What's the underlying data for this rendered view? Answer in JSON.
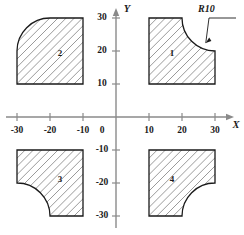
{
  "figure": {
    "background_color": "#ffffff",
    "line_color": "#1a1a1a",
    "axis_color": "#8a8a8a",
    "hatch_color": "#6e6e6e"
  },
  "axes": {
    "x_name": "X",
    "y_name": "Y",
    "origin_label": "0",
    "x_ticks": [
      {
        "value": -30,
        "label": "-30"
      },
      {
        "value": -20,
        "label": "-20"
      },
      {
        "value": -10,
        "label": "-10"
      },
      {
        "value": 10,
        "label": "10"
      },
      {
        "value": 20,
        "label": "20"
      },
      {
        "value": 30,
        "label": "30"
      }
    ],
    "y_ticks": [
      {
        "value": 30,
        "label": "30"
      },
      {
        "value": 20,
        "label": "20"
      },
      {
        "value": 10,
        "label": "10"
      },
      {
        "value": -10,
        "label": "-10"
      },
      {
        "value": -20,
        "label": "-20"
      },
      {
        "value": -30,
        "label": "-30"
      }
    ]
  },
  "annotations": [
    {
      "name": "radius-callout",
      "text": "R10",
      "points_to_shape": "1",
      "radius_value": 10
    }
  ],
  "chart_data": {
    "type": "scatter",
    "title": "",
    "xlabel": "X",
    "ylabel": "Y",
    "xlim": [
      -34,
      34
    ],
    "ylim": [
      -34,
      34
    ],
    "grid": false,
    "legend": "none",
    "shapes": [
      {
        "label": "1",
        "quadrant": 1,
        "x_range": [
          10,
          30
        ],
        "y_range": [
          10,
          30
        ],
        "label_pos": [
          17,
          19
        ],
        "fillet": {
          "radius": 10,
          "center": [
            20,
            20
          ],
          "corner": "top-right",
          "start": [
            20,
            30
          ],
          "end": [
            30,
            20
          ],
          "concave": true
        }
      },
      {
        "label": "2",
        "quadrant": 2,
        "x_range": [
          -30,
          -10
        ],
        "y_range": [
          10,
          30
        ],
        "label_pos": [
          -17,
          19
        ],
        "fillet": {
          "radius": 10,
          "center": [
            -20,
            20
          ],
          "corner": "top-left",
          "start": [
            -30,
            20
          ],
          "end": [
            -20,
            30
          ],
          "concave": true
        }
      },
      {
        "label": "3",
        "quadrant": 3,
        "x_range": [
          -30,
          -10
        ],
        "y_range": [
          -30,
          -10
        ],
        "label_pos": [
          -17,
          -19
        ],
        "fillet": {
          "radius": 10,
          "center": [
            -20,
            -20
          ],
          "corner": "bottom-left",
          "start": [
            -30,
            -20
          ],
          "end": [
            -20,
            -30
          ],
          "concave": true
        }
      },
      {
        "label": "4",
        "quadrant": 4,
        "x_range": [
          10,
          30
        ],
        "y_range": [
          -30,
          -10
        ],
        "label_pos": [
          17,
          -19
        ],
        "fillet": {
          "radius": 10,
          "center": [
            20,
            -20
          ],
          "corner": "bottom-right",
          "start": [
            30,
            -20
          ],
          "end": [
            20,
            -30
          ],
          "concave": true
        }
      }
    ]
  }
}
